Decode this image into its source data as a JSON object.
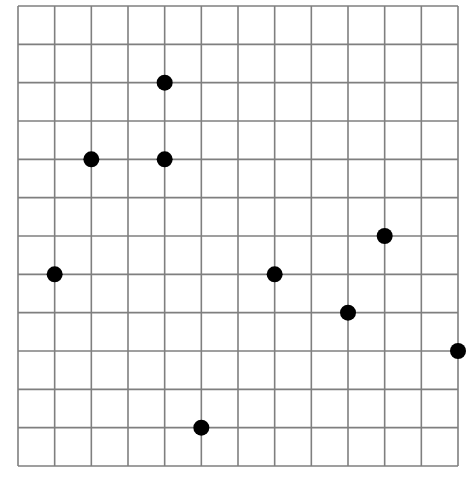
{
  "grid": {
    "columns": 12,
    "rows": 12,
    "origin_x": 18,
    "origin_y": 6,
    "width": 440,
    "height": 460,
    "line_color": "#7f7f7f",
    "background": "#ffffff"
  },
  "points": {
    "color": "#000000",
    "radius": 8,
    "items": [
      {
        "col": 4,
        "row": 2
      },
      {
        "col": 2,
        "row": 4
      },
      {
        "col": 4,
        "row": 4
      },
      {
        "col": 10,
        "row": 6
      },
      {
        "col": 1,
        "row": 7
      },
      {
        "col": 7,
        "row": 7
      },
      {
        "col": 9,
        "row": 8
      },
      {
        "col": 12,
        "row": 9
      },
      {
        "col": 5,
        "row": 11
      }
    ]
  }
}
